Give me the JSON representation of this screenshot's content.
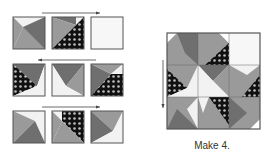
{
  "diagram": {
    "label": "Make 4.",
    "colors": {
      "dark": "#6f6f6f",
      "medium": "#9a9a9a",
      "light": "#f2f2f2",
      "white": "#ffffff",
      "dot_bg": "#111111",
      "dot": "#bdbdbd",
      "border": "#555555",
      "arrow": "#444444"
    },
    "steps": [
      {
        "row": 1,
        "arrow_direction": "right"
      },
      {
        "row": 2,
        "arrow_direction": "left"
      },
      {
        "row": 3,
        "arrow_direction": "right"
      }
    ],
    "assembled": {
      "arrow_direction": "down"
    }
  }
}
